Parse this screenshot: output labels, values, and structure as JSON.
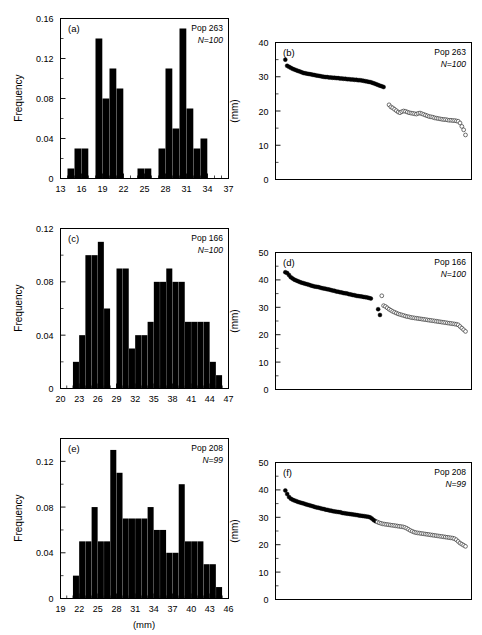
{
  "figure": {
    "width": 482,
    "height": 635,
    "axis_color": "#000000",
    "bar_color": "#000000",
    "filled_marker_color": "#000000",
    "open_marker_color": "#ffffff",
    "open_marker_stroke": "#333333"
  },
  "labels": {
    "frequency": "Frequency",
    "mm": "(mm)",
    "panel_a": "(a)",
    "panel_b": "(b)",
    "panel_c": "(c)",
    "panel_d": "(d)",
    "panel_e": "(e)",
    "panel_f": "(f)",
    "pop_263": "Pop 263",
    "pop_166": "Pop 166",
    "pop_208": "Pop 208",
    "n_100": "N=100",
    "n_99": "N=99"
  },
  "chart_data": [
    {
      "id": "a",
      "type": "bar",
      "panel_label": "(a)",
      "title": "Pop 263",
      "annotation_n": "N=100",
      "xlabel": "",
      "ylabel": "Frequency",
      "xlim": [
        13,
        37
      ],
      "ylim": [
        0,
        0.16
      ],
      "xticks": [
        13,
        16,
        19,
        22,
        25,
        28,
        31,
        34,
        37
      ],
      "yticks": [
        0,
        0.04,
        0.08,
        0.12,
        0.16
      ],
      "ytick_labels": [
        "0",
        "0.04",
        "0.08",
        "0.12",
        "0.16"
      ],
      "bin_width": 1,
      "categories": [
        13,
        14,
        15,
        16,
        17,
        18,
        19,
        20,
        21,
        22,
        23,
        24,
        25,
        26,
        27,
        28,
        29,
        30,
        31,
        32,
        33,
        34,
        35,
        36
      ],
      "values": [
        0,
        0.01,
        0.03,
        0.03,
        0,
        0.14,
        0.08,
        0.11,
        0.09,
        0,
        0,
        0.01,
        0.01,
        0,
        0.03,
        0.11,
        0.05,
        0.15,
        0.07,
        0.03,
        0.04,
        0,
        0,
        0
      ],
      "grid": false,
      "legend": "none"
    },
    {
      "id": "b",
      "type": "scatter",
      "panel_label": "(b)",
      "title": "Pop 263",
      "annotation_n": "N=100",
      "xlabel": "",
      "ylabel": "(mm)",
      "xlim": [
        0,
        100
      ],
      "ylim": [
        0,
        40
      ],
      "yticks": [
        0,
        10,
        20,
        30,
        40
      ],
      "ytick_labels": [
        "0",
        "10",
        "20",
        "30",
        "40"
      ],
      "grid": false,
      "legend": "none",
      "series": [
        {
          "name": "filled",
          "marker": "filled-circle",
          "x": [
            1,
            2,
            3,
            4,
            5,
            6,
            7,
            8,
            9,
            10,
            11,
            12,
            13,
            14,
            15,
            16,
            17,
            18,
            19,
            20,
            21,
            22,
            23,
            24,
            25,
            26,
            27,
            28,
            29,
            30,
            31,
            32,
            33,
            34,
            35,
            36,
            37,
            38,
            39,
            40,
            41,
            42,
            43,
            44,
            45,
            46,
            47,
            48,
            49,
            50,
            51,
            52,
            53,
            54,
            55
          ],
          "y": [
            35.0,
            33.2,
            32.9,
            32.6,
            32.3,
            32.1,
            31.9,
            31.7,
            31.5,
            31.3,
            31.1,
            31.0,
            30.9,
            30.8,
            30.7,
            30.6,
            30.5,
            30.4,
            30.3,
            30.2,
            30.1,
            30.0,
            29.9,
            29.9,
            29.8,
            29.8,
            29.7,
            29.7,
            29.6,
            29.6,
            29.5,
            29.5,
            29.4,
            29.4,
            29.3,
            29.3,
            29.2,
            29.2,
            29.1,
            29.1,
            29.0,
            29.0,
            28.9,
            28.8,
            28.7,
            28.6,
            28.5,
            28.4,
            28.2,
            28.0,
            27.8,
            27.6,
            27.4,
            27.2,
            27.0
          ]
        },
        {
          "name": "open",
          "marker": "open-circle",
          "x": [
            58,
            59,
            60,
            61,
            62,
            63,
            64,
            65,
            66,
            67,
            68,
            69,
            70,
            71,
            72,
            73,
            74,
            75,
            76,
            77,
            78,
            79,
            80,
            81,
            82,
            83,
            84,
            85,
            86,
            87,
            88,
            89,
            90,
            91,
            92,
            93,
            94,
            95,
            96,
            97,
            98,
            99,
            100
          ],
          "y": [
            21.8,
            21.2,
            20.9,
            20.5,
            20.1,
            19.7,
            19.5,
            19.8,
            20.0,
            19.9,
            19.7,
            19.5,
            19.4,
            19.3,
            19.2,
            19.1,
            19.3,
            19.4,
            19.2,
            19.0,
            18.8,
            18.6,
            18.4,
            18.3,
            18.2,
            18.0,
            17.9,
            17.8,
            17.7,
            17.6,
            17.5,
            17.5,
            17.4,
            17.3,
            17.3,
            17.2,
            17.2,
            17.1,
            17.0,
            16.5,
            15.5,
            14.5,
            13.0
          ]
        }
      ]
    },
    {
      "id": "c",
      "type": "bar",
      "panel_label": "(c)",
      "title": "Pop 166",
      "annotation_n": "N=100",
      "xlabel": "",
      "ylabel": "Frequency",
      "xlim": [
        20,
        47
      ],
      "ylim": [
        0,
        0.12
      ],
      "xticks": [
        20,
        23,
        26,
        29,
        32,
        35,
        38,
        41,
        44,
        47
      ],
      "yticks": [
        0,
        0.04,
        0.08,
        0.12
      ],
      "ytick_labels": [
        "0",
        "0.04",
        "0.08",
        "0.12"
      ],
      "bin_width": 1,
      "categories": [
        20,
        21,
        22,
        23,
        24,
        25,
        26,
        27,
        28,
        29,
        30,
        31,
        32,
        33,
        34,
        35,
        36,
        37,
        38,
        39,
        40,
        41,
        42,
        43,
        44,
        45,
        46
      ],
      "values": [
        0,
        0,
        0.02,
        0.04,
        0.1,
        0.1,
        0.11,
        0.06,
        0,
        0.09,
        0.09,
        0.03,
        0.04,
        0.04,
        0.05,
        0.08,
        0.08,
        0.09,
        0.08,
        0.08,
        0.05,
        0.05,
        0.05,
        0.05,
        0.02,
        0.01,
        0
      ],
      "grid": false,
      "legend": "none"
    },
    {
      "id": "d",
      "type": "scatter",
      "panel_label": "(d)",
      "title": "Pop 166",
      "annotation_n": "N=100",
      "xlabel": "",
      "ylabel": "(mm)",
      "xlim": [
        0,
        100
      ],
      "ylim": [
        0,
        50
      ],
      "yticks": [
        0,
        10,
        20,
        30,
        40,
        50
      ],
      "ytick_labels": [
        "0",
        "10",
        "20",
        "30",
        "40",
        "50"
      ],
      "grid": false,
      "legend": "none",
      "series": [
        {
          "name": "filled",
          "marker": "filled-circle",
          "x": [
            1,
            2,
            3,
            4,
            5,
            6,
            7,
            8,
            9,
            10,
            11,
            12,
            13,
            14,
            15,
            16,
            17,
            18,
            19,
            20,
            21,
            22,
            23,
            24,
            25,
            26,
            27,
            28,
            29,
            30,
            31,
            32,
            33,
            34,
            35,
            36,
            37,
            38,
            39,
            40,
            41,
            42,
            43,
            44,
            45,
            46,
            47,
            48
          ],
          "y": [
            42.8,
            42.5,
            41.8,
            41.0,
            40.5,
            40.1,
            39.8,
            39.5,
            39.2,
            39.0,
            38.8,
            38.6,
            38.4,
            38.2,
            38.0,
            37.8,
            37.6,
            37.5,
            37.4,
            37.2,
            37.0,
            36.9,
            36.8,
            36.6,
            36.5,
            36.3,
            36.1,
            36.0,
            35.8,
            35.7,
            35.5,
            35.4,
            35.2,
            35.1,
            35.0,
            34.8,
            34.7,
            34.5,
            34.4,
            34.2,
            34.1,
            34.0,
            33.9,
            33.8,
            33.7,
            33.6,
            33.4,
            33.2
          ]
        },
        {
          "name": "filled-outliers",
          "marker": "filled-circle",
          "x": [
            52,
            53
          ],
          "y": [
            29.3,
            27.2
          ]
        },
        {
          "name": "open-outlier",
          "marker": "open-circle",
          "x": [
            54
          ],
          "y": [
            34.2
          ]
        },
        {
          "name": "open",
          "marker": "open-circle",
          "x": [
            55,
            56,
            57,
            58,
            59,
            60,
            61,
            62,
            63,
            64,
            65,
            66,
            67,
            68,
            69,
            70,
            71,
            72,
            73,
            74,
            75,
            76,
            77,
            78,
            79,
            80,
            81,
            82,
            83,
            84,
            85,
            86,
            87,
            88,
            89,
            90,
            91,
            92,
            93,
            94,
            95,
            96,
            97,
            98,
            99,
            100
          ],
          "y": [
            30.6,
            30.3,
            29.8,
            29.3,
            28.9,
            28.5,
            28.2,
            27.9,
            27.6,
            27.4,
            27.2,
            27.0,
            26.8,
            26.6,
            26.5,
            26.3,
            26.2,
            26.1,
            26.0,
            25.9,
            25.8,
            25.7,
            25.6,
            25.5,
            25.4,
            25.3,
            25.2,
            25.1,
            25.0,
            24.9,
            24.8,
            24.7,
            24.6,
            24.5,
            24.4,
            24.3,
            24.2,
            24.1,
            24.0,
            23.9,
            23.8,
            23.6,
            23.0,
            22.4,
            21.8,
            21.2
          ]
        }
      ]
    },
    {
      "id": "e",
      "type": "bar",
      "panel_label": "(e)",
      "title": "Pop 208",
      "annotation_n": "N=99",
      "xlabel": "(mm)",
      "ylabel": "Frequency",
      "xlim": [
        19,
        46
      ],
      "ylim": [
        0,
        0.14
      ],
      "xticks": [
        19,
        22,
        25,
        28,
        31,
        34,
        37,
        40,
        43,
        46
      ],
      "yticks": [
        0,
        0.04,
        0.08,
        0.12
      ],
      "ytick_labels": [
        "0",
        "0.04",
        "0.08",
        "0.12"
      ],
      "bin_width": 1,
      "categories": [
        19,
        20,
        21,
        22,
        23,
        24,
        25,
        26,
        27,
        28,
        29,
        30,
        31,
        32,
        33,
        34,
        35,
        36,
        37,
        38,
        39,
        40,
        41,
        42,
        43,
        44,
        45
      ],
      "values": [
        0,
        0,
        0.02,
        0.05,
        0.05,
        0.08,
        0.05,
        0.05,
        0.13,
        0.11,
        0.07,
        0.07,
        0.07,
        0.07,
        0.08,
        0.06,
        0.06,
        0.04,
        0.04,
        0.1,
        0.05,
        0.05,
        0.05,
        0.03,
        0.03,
        0.01,
        0
      ],
      "grid": false,
      "legend": "none"
    },
    {
      "id": "f",
      "type": "scatter",
      "panel_label": "(f)",
      "title": "Pop 208",
      "annotation_n": "N=99",
      "xlabel": "",
      "ylabel": "(mm)",
      "xlim": [
        0,
        99
      ],
      "ylim": [
        0,
        50
      ],
      "yticks": [
        0,
        10,
        20,
        30,
        40,
        50
      ],
      "ytick_labels": [
        "0",
        "10",
        "20",
        "30",
        "40",
        "50"
      ],
      "grid": false,
      "legend": "none",
      "series": [
        {
          "name": "filled",
          "marker": "filled-circle",
          "x": [
            1,
            2,
            3,
            4,
            5,
            6,
            7,
            8,
            9,
            10,
            11,
            12,
            13,
            14,
            15,
            16,
            17,
            18,
            19,
            20,
            21,
            22,
            23,
            24,
            25,
            26,
            27,
            28,
            29,
            30,
            31,
            32,
            33,
            34,
            35,
            36,
            37,
            38,
            39,
            40,
            41,
            42,
            43,
            44,
            45,
            46,
            47,
            48,
            49,
            50
          ],
          "y": [
            39.8,
            38.5,
            37.4,
            36.8,
            36.4,
            36.1,
            35.9,
            35.6,
            35.4,
            35.2,
            35.0,
            34.8,
            34.6,
            34.4,
            34.2,
            34.0,
            33.8,
            33.6,
            33.5,
            33.3,
            33.1,
            33.0,
            32.8,
            32.7,
            32.5,
            32.4,
            32.2,
            32.1,
            32.0,
            31.9,
            31.8,
            31.6,
            31.5,
            31.4,
            31.3,
            31.2,
            31.1,
            31.0,
            30.9,
            30.8,
            30.7,
            30.6,
            30.5,
            30.4,
            30.3,
            30.2,
            30.0,
            29.6,
            29.0,
            28.6
          ]
        },
        {
          "name": "open",
          "marker": "open-circle",
          "x": [
            51,
            52,
            53,
            54,
            55,
            56,
            57,
            58,
            59,
            60,
            61,
            62,
            63,
            64,
            65,
            66,
            67,
            68,
            69,
            70,
            71,
            72,
            73,
            74,
            75,
            76,
            77,
            78,
            79,
            80,
            81,
            82,
            83,
            84,
            85,
            86,
            87,
            88,
            89,
            90,
            91,
            92,
            93,
            94,
            95,
            96,
            97,
            98,
            99
          ],
          "y": [
            28.3,
            28.0,
            27.8,
            27.6,
            27.5,
            27.4,
            27.3,
            27.2,
            27.1,
            27.0,
            26.9,
            26.8,
            26.7,
            26.6,
            26.5,
            26.3,
            26.0,
            25.6,
            25.2,
            24.9,
            24.6,
            24.4,
            24.3,
            24.2,
            24.1,
            24.0,
            23.9,
            23.8,
            23.7,
            23.6,
            23.5,
            23.4,
            23.3,
            23.2,
            23.1,
            23.0,
            22.9,
            22.8,
            22.7,
            22.6,
            22.5,
            22.4,
            22.2,
            21.8,
            21.2,
            20.6,
            20.2,
            19.8,
            19.4
          ]
        }
      ]
    }
  ]
}
